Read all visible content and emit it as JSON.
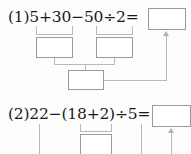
{
  "worksheet": {
    "problems": [
      {
        "label": "(1)",
        "expression_parts": [
          "5",
          "+",
          "30",
          "−",
          "50",
          "÷",
          "2",
          "="
        ],
        "expression_text": "5+30−50÷2=",
        "answer_value": "",
        "answer_placeholder": "",
        "step_boxes": [
          {
            "name": "step-box-1a",
            "value": ""
          },
          {
            "name": "step-box-1b",
            "value": ""
          },
          {
            "name": "step-box-1c",
            "value": ""
          }
        ]
      },
      {
        "label": "(2)",
        "expression_parts": [
          "22",
          "−",
          "(",
          "18",
          "+",
          "2",
          ")",
          "÷",
          "5",
          "="
        ],
        "expression_text": "22−(18+2)÷5=",
        "answer_value": "",
        "answer_placeholder": "",
        "step_boxes": [
          {
            "name": "step-box-2a",
            "value": ""
          }
        ]
      }
    ],
    "colors": {
      "ink": "#1a1a1a",
      "box_border": "#9a9a9a",
      "connector": "#b9b9b9",
      "page": "#fdfdfd"
    }
  }
}
